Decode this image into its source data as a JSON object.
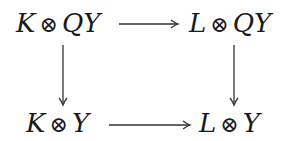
{
  "diagram": {
    "type": "commutative-square",
    "nodes": {
      "top_left": {
        "left": "K",
        "op": "⊗",
        "right": "QY"
      },
      "top_right": {
        "left": "L",
        "op": "⊗",
        "right": "QY"
      },
      "bottom_left": {
        "left": "K",
        "op": "⊗",
        "right": "Y"
      },
      "bottom_right": {
        "left": "L",
        "op": "⊗",
        "right": "Y"
      }
    },
    "edges": [
      {
        "from": "top_left",
        "to": "top_right"
      },
      {
        "from": "top_left",
        "to": "bottom_left"
      },
      {
        "from": "top_right",
        "to": "bottom_right"
      },
      {
        "from": "bottom_left",
        "to": "bottom_right"
      }
    ],
    "stroke_color": "#333333"
  }
}
